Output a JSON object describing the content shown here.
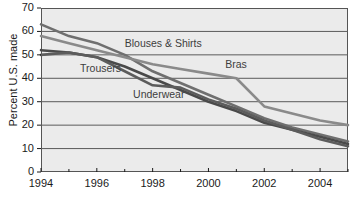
{
  "chart_data": {
    "type": "line",
    "title": "",
    "subtitle": "",
    "xlabel": "",
    "ylabel": "Percent U.S. made",
    "xlim": [
      1994,
      2005
    ],
    "ylim": [
      0,
      70
    ],
    "grid": true,
    "grid_axis": "y",
    "legend_position": "inline-annotations",
    "background_color": "#ebebeb",
    "x": [
      1994,
      1995,
      1996,
      1997,
      1998,
      1999,
      2000,
      2001,
      2002,
      2003,
      2004,
      2005
    ],
    "y_ticks": [
      0,
      10,
      20,
      30,
      40,
      50,
      60,
      70
    ],
    "y_tick_labels": [
      "0",
      "10",
      "20",
      "30",
      "40",
      "50",
      "60",
      "70"
    ],
    "x_ticks": [
      1994,
      1995,
      1996,
      1997,
      1998,
      1999,
      2000,
      2001,
      2002,
      2003,
      2004,
      2005
    ],
    "x_tick_labels_major": [
      "1994",
      "1996",
      "1998",
      "2000",
      "2002",
      "2004"
    ],
    "x_major_ticks": [
      1994,
      1996,
      1998,
      2000,
      2002,
      2004
    ],
    "series": [
      {
        "name": "Blouses & Shirts",
        "color": "#6f6f6f",
        "values": [
          63,
          58,
          55,
          50,
          43,
          38,
          33,
          28,
          23,
          19,
          16,
          13
        ]
      },
      {
        "name": "Bras",
        "color": "#8a8a8a",
        "values": [
          58,
          55,
          52,
          49,
          46,
          44,
          42,
          40,
          28,
          25,
          22,
          20
        ]
      },
      {
        "name": "Trousers",
        "color": "#4a4a4a",
        "values": [
          52,
          51,
          49,
          45,
          40,
          35,
          30,
          26,
          21,
          18,
          15,
          12
        ]
      },
      {
        "name": "Underwear",
        "color": "#5c5c5c",
        "values": [
          50,
          51,
          49,
          43,
          37,
          36,
          31,
          27,
          22,
          18,
          14,
          11
        ]
      }
    ],
    "annotations": [
      {
        "text": "Blouses & Shirts",
        "x": 1997.0,
        "y": 54.5
      },
      {
        "text": "Bras",
        "x": 2000.6,
        "y": 45.5
      },
      {
        "text": "Trousers",
        "x": 1995.4,
        "y": 44.0
      },
      {
        "text": "Underwear",
        "x": 1997.3,
        "y": 33.0
      }
    ]
  }
}
